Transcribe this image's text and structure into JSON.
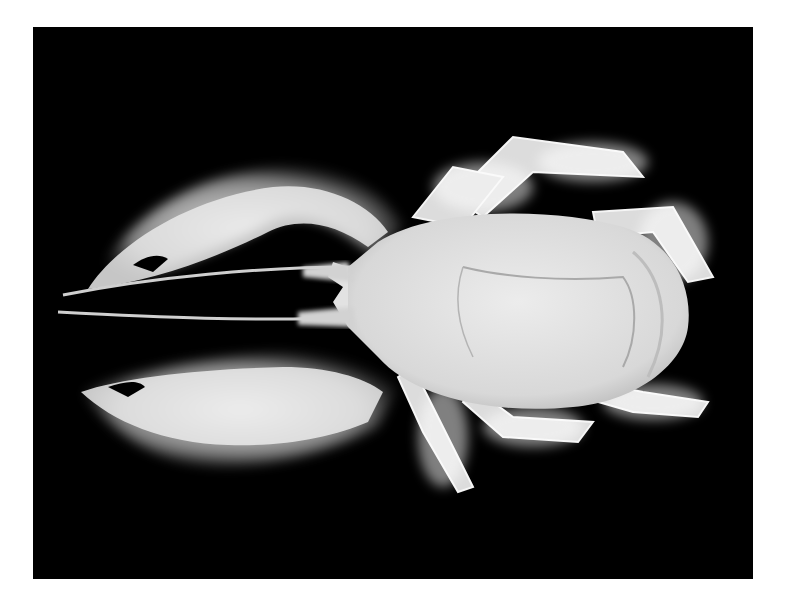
{
  "image": {
    "subject": "yeti crab",
    "description": "Photograph of a white hairy yeti crab (Kiwa) viewed from above on a black background",
    "background_color": "#000000",
    "page_color": "#ffffff",
    "body_color": "#e4e4e4",
    "hair_color": "#f2f2f2"
  }
}
